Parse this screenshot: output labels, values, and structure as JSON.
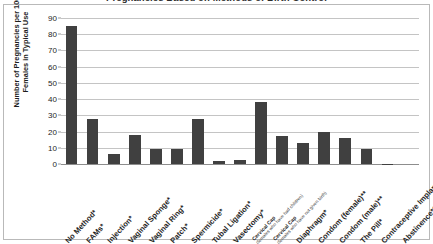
{
  "chart_data": {
    "type": "bar",
    "title": "Pregnancies Based on Methods of Birth Control",
    "xlabel": "",
    "ylabel": "Number of Pregnancies per 100 Females in Typical Use",
    "ylim": [
      0,
      90
    ],
    "ytick_step": 10,
    "yticks": [
      "90",
      "80",
      "70",
      "60",
      "50",
      "40",
      "30",
      "20",
      "10",
      "0"
    ],
    "grid": "horizontal",
    "legend": "none",
    "bar_color": "#404040",
    "categories": [
      "No Method*",
      "FAMs*",
      "Injection*",
      "Vaginal Sponge*",
      "Vaginal Ring*",
      "Patch*",
      "Spermicide*",
      "Tubal Ligation*",
      "Vasectomy*",
      "Cervical Cap",
      "Cervical Cap",
      "Diaphragm*",
      "Condom (female)**",
      "Condom (male)**",
      "The Pill*",
      "Contraceptive Implant*",
      "Abstinence***"
    ],
    "category_sublabels": [
      "",
      "",
      "",
      "",
      "",
      "",
      "",
      "",
      "",
      "(females who have had children)",
      "(females who have not given birth)",
      "",
      "",
      "",
      "",
      "",
      ""
    ],
    "values": [
      85,
      28,
      6,
      18,
      9,
      9,
      28,
      2,
      2.5,
      38,
      17,
      13,
      20,
      16,
      9,
      0.05,
      0
    ]
  },
  "axis": {
    "y_title": "Number of Pregnancies per 100 Females in Typical Use"
  }
}
